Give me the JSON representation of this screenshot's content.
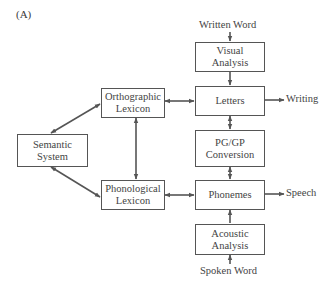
{
  "panel_label": "(A)",
  "nodes": {
    "orthographic_lexicon": "Orthographic\nLexicon",
    "semantic_system": "Semantic\nSystem",
    "phonological_lexicon": "Phonological\nLexicon",
    "visual_analysis": "Visual\nAnalysis",
    "letters": "Letters",
    "pg_gp_conversion": "PG/GP\nConversion",
    "phonemes": "Phonemes",
    "acoustic_analysis": "Acoustic\nAnalysis"
  },
  "external": {
    "written_word": "Written Word",
    "writing": "Writing",
    "speech": "Speech",
    "spoken_word": "Spoken Word"
  },
  "edges": [
    {
      "from": "written_word",
      "to": "visual_analysis",
      "type": "one-way"
    },
    {
      "from": "visual_analysis",
      "to": "letters",
      "type": "one-way"
    },
    {
      "from": "letters",
      "to": "writing",
      "type": "one-way"
    },
    {
      "from": "orthographic_lexicon",
      "to": "letters",
      "type": "two-way"
    },
    {
      "from": "letters",
      "to": "pg_gp_conversion",
      "type": "two-way"
    },
    {
      "from": "pg_gp_conversion",
      "to": "phonemes",
      "type": "two-way"
    },
    {
      "from": "phonological_lexicon",
      "to": "phonemes",
      "type": "two-way"
    },
    {
      "from": "phonemes",
      "to": "speech",
      "type": "one-way"
    },
    {
      "from": "acoustic_analysis",
      "to": "phonemes",
      "type": "one-way"
    },
    {
      "from": "spoken_word",
      "to": "acoustic_analysis",
      "type": "one-way"
    },
    {
      "from": "semantic_system",
      "to": "orthographic_lexicon",
      "type": "two-way"
    },
    {
      "from": "semantic_system",
      "to": "phonological_lexicon",
      "type": "two-way"
    },
    {
      "from": "orthographic_lexicon",
      "to": "phonological_lexicon",
      "type": "two-way"
    }
  ],
  "colors": {
    "line": "#555555",
    "text": "#444444",
    "background": "#ffffff"
  }
}
